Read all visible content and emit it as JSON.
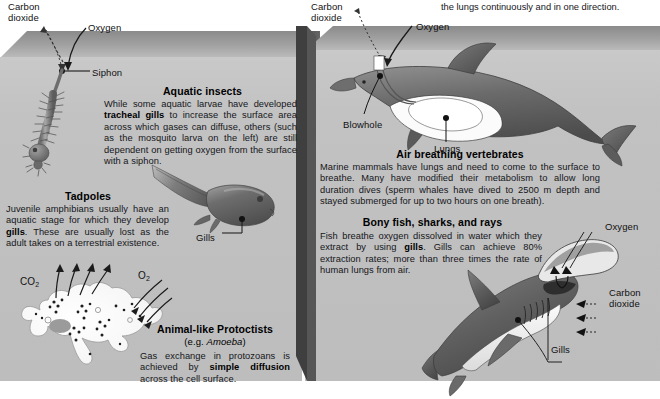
{
  "diagram": {
    "top_note": "the lungs continuously and in one direction."
  },
  "left_panel": {
    "name": "aquatic-water-tank",
    "surface_labels": {
      "carbon_dioxide": "Carbon\ndioxide",
      "oxygen": "Oxygen",
      "siphon": "Siphon"
    },
    "sections": [
      {
        "id": "aquatic-insects",
        "heading": "Aquatic insects",
        "body_runs": [
          {
            "t": "While some aquatic larvae have developed ",
            "b": false
          },
          {
            "t": "tracheal gills",
            "b": true
          },
          {
            "t": " to increase the surface area across which gases can diffuse, others (such as the mosquito larva on the left) are still dependent on getting oxygen from the surface with a siphon.",
            "b": false
          }
        ],
        "body_text": "While some aquatic larvae have developed tracheal gills to increase the surface area across which gases can diffuse, others (such as the mosquito larva on the left) are still dependent on getting oxygen from the surface with a siphon."
      },
      {
        "id": "tadpoles",
        "heading": "Tadpoles",
        "body_runs": [
          {
            "t": "Juvenile amphibians usually have an aquatic stage for which they develop ",
            "b": false
          },
          {
            "t": "gills",
            "b": true
          },
          {
            "t": ". These are usually lost as the adult takes on a terrestrial existence.",
            "b": false
          }
        ],
        "body_text": "Juvenile amphibians usually have an aquatic stage for which they develop gills. These are usually lost as the adult takes on a terrestrial existence.",
        "label_gills": "Gills"
      },
      {
        "id": "animal-like-protoctists",
        "heading": "Animal-like Protoctists",
        "subheading_prefix": "(e.g. ",
        "subheading_italic": "Amoeba",
        "subheading_suffix": ")",
        "body_runs": [
          {
            "t": "Gas exchange in protozoans is achieved by ",
            "b": false
          },
          {
            "t": "simple diffusion",
            "b": true
          },
          {
            "t": " across the cell surface.",
            "b": false
          }
        ],
        "body_text": "Gas exchange in protozoans is achieved by simple diffusion across the cell surface.",
        "gas_out": "CO",
        "gas_out_sub": "2",
        "gas_in": "O",
        "gas_in_sub": "2"
      }
    ]
  },
  "right_panel": {
    "name": "marine-vertebrates-tank",
    "surface_labels": {
      "carbon_dioxide": "Carbon\ndioxide",
      "oxygen": "Oxygen"
    },
    "dolphin_labels": {
      "blowhole": "Blowhole",
      "lungs": "Lungs"
    },
    "shark_labels": {
      "oxygen": "Oxygen",
      "carbon_dioxide": "Carbon\ndioxide",
      "gills": "Gills"
    },
    "sections": [
      {
        "id": "air-breathing-vertebrates",
        "heading": "Air breathing vertebrates",
        "body_text": "Marine mammals have lungs and need to come to the surface to breathe. Many have modified their metabolism to allow long duration dives (sperm whales have dived to 2500 m depth and stayed submerged for up to two hours on one breath)."
      },
      {
        "id": "bony-fish-sharks-rays",
        "heading": "Bony fish, sharks, and rays",
        "body_runs": [
          {
            "t": "Fish breathe oxygen dissolved in water which they extract by using ",
            "b": false
          },
          {
            "t": "gills",
            "b": true
          },
          {
            "t": ". Gills can achieve 80% extraction rates; more than three times the rate of human lungs from air.",
            "b": false
          }
        ],
        "body_text": "Fish breathe oxygen dissolved in water which they extract by using gills. Gills can achieve 80% extraction rates; more than three times the rate of human lungs from air.",
        "stat_extraction": "80%",
        "stat_depth": "2500 m"
      }
    ]
  },
  "colors": {
    "water_front": "#c2c2c2",
    "water_surface_dark": "#8f8f8f",
    "panel_side": "#525252",
    "page_background": "#ffffff",
    "text": "#15161a",
    "organism_dark": "#5e5e5e",
    "organism_light": "#f2f2f2"
  }
}
